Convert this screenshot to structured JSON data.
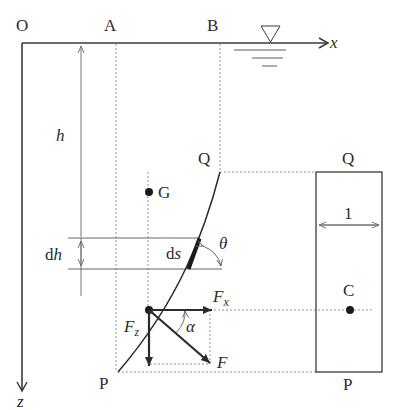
{
  "diagram": {
    "points": {
      "origin": "O",
      "a": "A",
      "b": "B",
      "q_left": "Q",
      "p_left": "P",
      "g": "G",
      "q_right": "Q",
      "p_right": "P",
      "c": "C"
    },
    "axes": {
      "x": "x",
      "z": "z"
    },
    "dimensions": {
      "depth": "h",
      "depth_increment_d": "d",
      "depth_increment_h": "h",
      "arc_element_d": "d",
      "arc_element_s": "s",
      "angle_theta": "θ",
      "angle_alpha": "α",
      "width": "1"
    },
    "forces": {
      "horizontal_main": "F",
      "horizontal_sub": "x",
      "vertical_main": "F",
      "vertical_sub": "z",
      "resultant": "F"
    },
    "colors": {
      "line": "#3a3a3a",
      "dashed": "#8a8a8a",
      "text": "#2b2b2b"
    }
  }
}
